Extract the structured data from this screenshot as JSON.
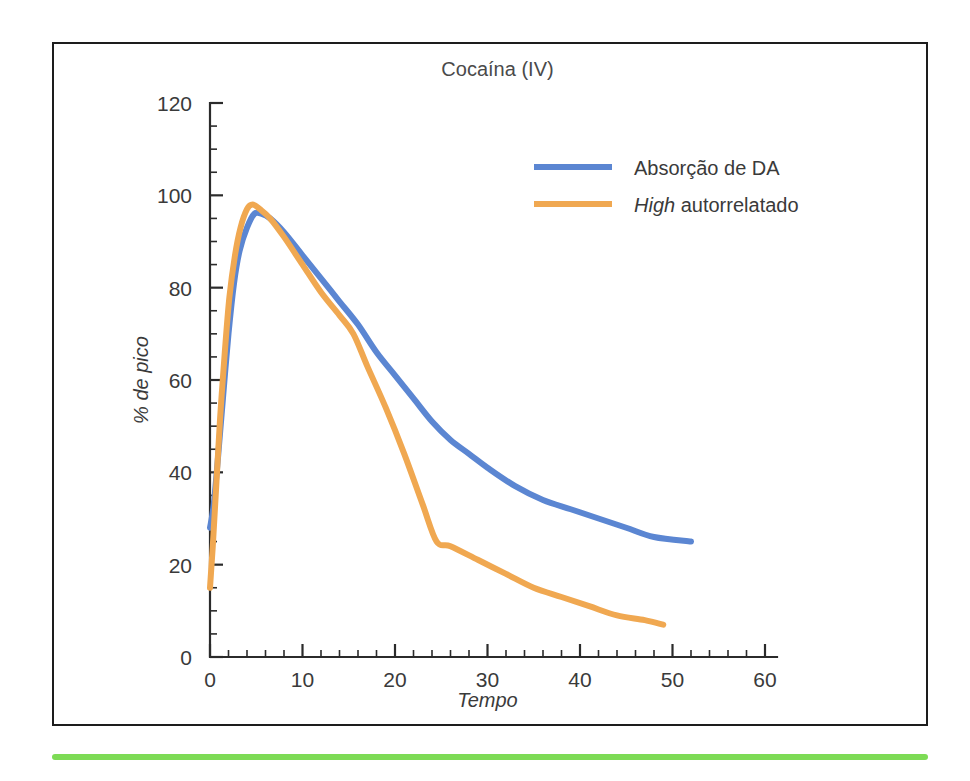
{
  "figure": {
    "frame_color": "#1d1d1d",
    "accent_rule_color": "#7ddb55",
    "background": "#ffffff"
  },
  "chart_data": {
    "type": "line",
    "title": "Cocaína (IV)",
    "xlabel": "Tempo",
    "ylabel": "% de pico",
    "xlim": [
      0,
      60
    ],
    "ylim": [
      0,
      120
    ],
    "xticks": [
      0,
      10,
      20,
      30,
      40,
      50,
      60
    ],
    "yticks": [
      0,
      20,
      40,
      60,
      80,
      100,
      120
    ],
    "xtick_labels": [
      "0",
      "10",
      "20",
      "30",
      "40",
      "50",
      "60"
    ],
    "ytick_labels": [
      "0",
      "20",
      "40",
      "60",
      "80",
      "100",
      "120"
    ],
    "x_minor_step": 2,
    "y_minor_step": 5,
    "grid": false,
    "legend_position": "upper right",
    "series": [
      {
        "name": "Absorção de DA",
        "name_italic_prefix": "",
        "color": "#5b86d2",
        "points": [
          [
            0.0,
            28
          ],
          [
            0.4,
            33
          ],
          [
            0.9,
            44
          ],
          [
            1.4,
            56
          ],
          [
            2.0,
            70
          ],
          [
            2.6,
            81
          ],
          [
            3.2,
            88
          ],
          [
            4.0,
            93
          ],
          [
            4.8,
            96
          ],
          [
            5.6,
            96
          ],
          [
            6.5,
            95
          ],
          [
            8.0,
            92
          ],
          [
            10.0,
            87
          ],
          [
            12.0,
            82
          ],
          [
            14.0,
            77
          ],
          [
            16.0,
            72
          ],
          [
            18.0,
            66
          ],
          [
            20.0,
            61
          ],
          [
            22.0,
            56
          ],
          [
            24.0,
            51
          ],
          [
            26.0,
            47
          ],
          [
            28.0,
            44
          ],
          [
            30.0,
            41
          ],
          [
            33.0,
            37
          ],
          [
            36.0,
            34
          ],
          [
            39.0,
            32
          ],
          [
            42.0,
            30
          ],
          [
            45.0,
            28
          ],
          [
            48.0,
            26
          ],
          [
            52.0,
            25
          ]
        ]
      },
      {
        "name": "High autorrelatado",
        "name_italic_prefix": "High",
        "color": "#f0a851",
        "points": [
          [
            0.0,
            15
          ],
          [
            0.3,
            24
          ],
          [
            0.7,
            38
          ],
          [
            1.1,
            52
          ],
          [
            1.6,
            66
          ],
          [
            2.1,
            78
          ],
          [
            2.7,
            87
          ],
          [
            3.3,
            93
          ],
          [
            4.0,
            97
          ],
          [
            4.6,
            98
          ],
          [
            5.4,
            97
          ],
          [
            6.5,
            95
          ],
          [
            8.0,
            91
          ],
          [
            10.0,
            85
          ],
          [
            12.0,
            79
          ],
          [
            14.0,
            74
          ],
          [
            15.5,
            70
          ],
          [
            17.0,
            63
          ],
          [
            19.0,
            54
          ],
          [
            21.0,
            44
          ],
          [
            23.0,
            33
          ],
          [
            24.5,
            25
          ],
          [
            26.0,
            24
          ],
          [
            29.0,
            21
          ],
          [
            32.0,
            18
          ],
          [
            35.0,
            15
          ],
          [
            38.0,
            13
          ],
          [
            41.0,
            11
          ],
          [
            44.0,
            9
          ],
          [
            47.0,
            8
          ],
          [
            49.0,
            7
          ]
        ]
      }
    ]
  }
}
